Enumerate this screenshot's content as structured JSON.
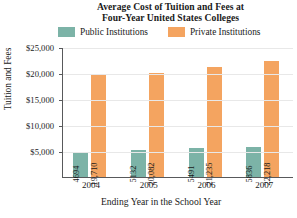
{
  "chart_data": {
    "type": "bar",
    "title": "Average Cost of Tuition and Fees at Four-Year United States Colleges",
    "title_lines": [
      "Average Cost of Tuition and Fees at",
      "Four-Year United States Colleges"
    ],
    "xlabel": "Ending Year in the School Year",
    "ylabel": "Tuition and Fees",
    "categories": [
      "2004",
      "2005",
      "2006",
      "2007"
    ],
    "series": [
      {
        "name": "Public Institutions",
        "color": "#7cb3a7",
        "values": [
          4694,
          5132,
          5491,
          5836
        ],
        "labels": [
          "4694",
          "5132",
          "5491",
          "5836"
        ]
      },
      {
        "name": "Private Institutions",
        "color": "#f4a460",
        "values": [
          19710,
          20082,
          21235,
          22218
        ],
        "labels": [
          "19,710",
          "20,082",
          "21,235",
          "22,218"
        ]
      }
    ],
    "ylim": [
      0,
      25000
    ],
    "yticks": [
      5000,
      10000,
      15000,
      20000,
      25000
    ],
    "ytick_labels": [
      "$5,000",
      "$10,000",
      "$15,000",
      "$20,000",
      "$25,000"
    ],
    "grid": true,
    "legend_position": "top"
  }
}
